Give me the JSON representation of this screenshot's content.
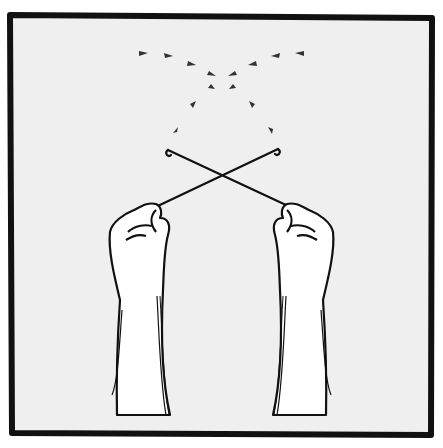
{
  "illustration": {
    "subject": "two fists holding crossed crochet hooks with arrow-like dashes",
    "colors": {
      "background": "#ffffff",
      "panel": "#efefef",
      "ink": "#111111",
      "arrow": "#333333",
      "hand": "#ffffff"
    },
    "icons": [
      "crochet-hook-icon",
      "fist-icon",
      "arrow-dash-icon"
    ]
  }
}
